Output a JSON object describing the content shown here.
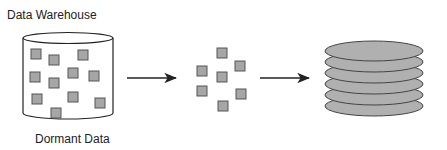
{
  "labels": {
    "top": "Data Warehouse",
    "bottom": "Dormant Data"
  },
  "colors": {
    "square_fill": "#a6a6a6",
    "square_stroke": "#555555",
    "disk_fill": "#b0b0b0",
    "disk_stroke": "#444444",
    "line": "#222222"
  },
  "warehouse_squares": [
    [
      31,
      49
    ],
    [
      49,
      55
    ],
    [
      78,
      50
    ],
    [
      30,
      72
    ],
    [
      49,
      78
    ],
    [
      68,
      68
    ],
    [
      89,
      71
    ],
    [
      32,
      94
    ],
    [
      68,
      92
    ],
    [
      95,
      98
    ],
    [
      51,
      108
    ]
  ],
  "extracted_squares": [
    [
      217,
      48
    ],
    [
      235,
      61
    ],
    [
      197,
      66
    ],
    [
      217,
      72
    ],
    [
      197,
      86
    ],
    [
      236,
      89
    ],
    [
      218,
      101
    ]
  ],
  "disk_count": 6
}
